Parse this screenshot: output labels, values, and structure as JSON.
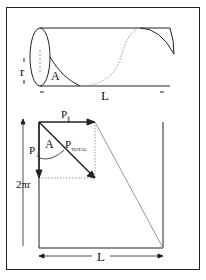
{
  "diagram": {
    "cylinder": {
      "radius_label": "r",
      "length_label": "L",
      "angle_label": "A"
    },
    "unrolled": {
      "parallel_label": "P",
      "parallel_sub": "∥",
      "perp_label": "P",
      "perp_sub": "⊥",
      "total_label": "P",
      "total_sub": "TOTAL",
      "angle_label": "A",
      "height_label": "2πr",
      "length_label": "L"
    },
    "colors": {
      "stroke": "#222222",
      "dotted": "#999999"
    }
  }
}
